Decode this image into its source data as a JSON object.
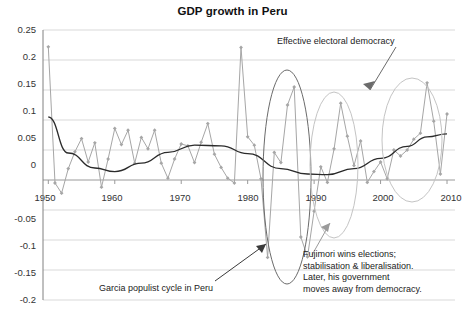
{
  "chart_data": {
    "type": "line",
    "title": "GDP growth in Peru",
    "xlabel": "",
    "ylabel": "",
    "xlim": [
      1949,
      2011
    ],
    "ylim": [
      -0.2,
      0.25
    ],
    "grid": true,
    "legend": "none",
    "x_ticks": [
      "1950",
      "1960",
      "1970",
      "1980",
      "1990",
      "2000",
      "2010"
    ],
    "y_ticks": [
      "0.25",
      "0.2",
      "0.15",
      "0.1",
      "0.05",
      "0",
      "-0.05",
      "-0.1",
      "-0.15",
      "-0.2"
    ],
    "series": [
      {
        "name": "GDP growth",
        "marker": "diamond",
        "color": "#a6a6a6",
        "x": [
          1950,
          1951,
          1952,
          1953,
          1954,
          1955,
          1956,
          1957,
          1958,
          1959,
          1960,
          1961,
          1962,
          1963,
          1964,
          1965,
          1966,
          1967,
          1968,
          1969,
          1970,
          1971,
          1972,
          1973,
          1974,
          1975,
          1976,
          1977,
          1978,
          1979,
          1980,
          1981,
          1982,
          1983,
          1984,
          1985,
          1986,
          1987,
          1988,
          1989,
          1990,
          1991,
          1992,
          1993,
          1994,
          1995,
          1996,
          1997,
          1998,
          1999,
          2000,
          2001,
          2002,
          2003,
          2004,
          2005,
          2006,
          2007,
          2008,
          2009,
          2010
        ],
        "values": [
          0.222,
          -0.005,
          -0.022,
          0.019,
          0.047,
          0.069,
          0.03,
          0.062,
          -0.012,
          0.035,
          0.086,
          0.059,
          0.083,
          0.028,
          0.071,
          0.052,
          0.083,
          0.028,
          0.003,
          0.035,
          0.06,
          0.057,
          0.029,
          0.063,
          0.094,
          0.043,
          0.021,
          0.003,
          -0.005,
          0.221,
          0.072,
          0.058,
          0.002,
          -0.129,
          0.046,
          0.029,
          0.125,
          0.155,
          -0.095,
          -0.128,
          -0.052,
          0.022,
          -0.004,
          0.052,
          0.128,
          0.073,
          0.024,
          0.065,
          -0.004,
          0.014,
          0.03,
          0.002,
          0.05,
          0.04,
          0.05,
          0.068,
          0.078,
          0.162,
          0.098,
          0.01,
          0.11
        ]
      },
      {
        "name": "Polynomial trend",
        "marker": "none",
        "color": "#2b2b2b",
        "kind": "trend"
      }
    ],
    "annotations": [
      {
        "name": "effective-electoral-democracy",
        "text": "Effective electoral democracy",
        "kind": "text-with-arrow"
      },
      {
        "name": "garcia-populist-cycle",
        "text": "Garcia populist cycle in Peru",
        "kind": "text-with-arrow"
      },
      {
        "name": "fujimori-note",
        "kind": "text-block",
        "lines": [
          "Fujimori wins elections;",
          "stabilisation & liberalisation.",
          "Later, his government",
          "moves away from democracy."
        ]
      },
      {
        "name": "ellipse-garcia",
        "kind": "ellipse",
        "color": "#595959"
      },
      {
        "name": "ellipse-fujimori",
        "kind": "ellipse",
        "color": "#bfbfbf"
      },
      {
        "name": "ellipse-democracy",
        "kind": "ellipse",
        "color": "#bfbfbf"
      }
    ],
    "colors": {
      "series": "#a6a6a6",
      "trend": "#2b2b2b",
      "grid": "#d9d9d9",
      "axis": "#808080",
      "text": "#222222"
    }
  }
}
